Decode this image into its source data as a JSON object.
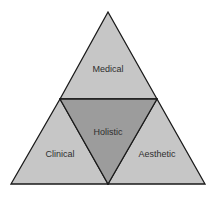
{
  "diagram": {
    "type": "triangle-partition",
    "segments": {
      "top": {
        "label": "Medical",
        "color": "#c6c6c6"
      },
      "left": {
        "label": "Clinical",
        "color": "#c6c6c6"
      },
      "right": {
        "label": "Aesthetic",
        "color": "#c6c6c6"
      },
      "center": {
        "label": "Holistic",
        "color": "#9c9c9c"
      }
    },
    "stroke_color": "#1a1a1a"
  }
}
